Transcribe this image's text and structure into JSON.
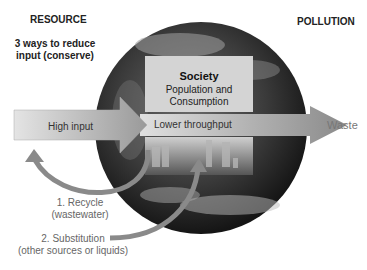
{
  "headers": {
    "resource": "RESOURCE",
    "pollution": "POLLUTION"
  },
  "subtitle": {
    "line1": "3 ways to reduce",
    "line2": "input (conserve)"
  },
  "society_box": {
    "title": "Society",
    "line1": "Population and",
    "line2": "Consumption"
  },
  "arrows": {
    "high_input": "High input",
    "lower_throughput": "Lower throughput",
    "waste": "Waste"
  },
  "methods": [
    {
      "line1": "1. Recycle",
      "line2": "(wastewater)"
    },
    {
      "line1": "2. Substitution",
      "line2": "(other sources or liquids)"
    }
  ],
  "colors": {
    "arrow_gray": "#8a8a8a",
    "box_gray": "#d4d4d4",
    "globe_dark": "#2a2a2a"
  }
}
